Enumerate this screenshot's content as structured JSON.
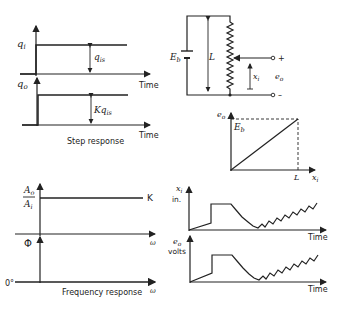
{
  "step_response": {
    "title": "Step response",
    "input_label": "q",
    "input_sub": "i",
    "output_label": "q",
    "output_sub": "o",
    "input_amplitude_label": "q",
    "input_amplitude_sub": "is",
    "output_amplitude_label": "Kq",
    "output_amplitude_sub": "is",
    "time_label_1": "Time",
    "time_label_2": "Time"
  },
  "circuit": {
    "battery_label": "E",
    "battery_sub": "b",
    "length_label": "L",
    "displacement_label": "x",
    "displacement_sub": "i",
    "output_label": "e",
    "output_sub": "o",
    "plus": "+",
    "minus": "–"
  },
  "static_characteristic": {
    "y_label": "e",
    "y_sub": "o",
    "y_max_label": "E",
    "y_max_sub": "b",
    "x_label": "x",
    "x_sub": "i",
    "x_max_label": "L"
  },
  "frequency_response": {
    "title": "Frequency response",
    "amp_num": "A",
    "amp_num_sub": "o",
    "amp_den": "A",
    "amp_den_sub": "i",
    "gain_label": "K",
    "phase_label": "Φ",
    "phase_zero": "0°",
    "omega_1": "ω",
    "omega_2": "ω"
  },
  "time_plots": {
    "input_label": "x",
    "input_sub": "i",
    "input_unit": "in.",
    "output_label": "e",
    "output_sub": "o",
    "output_unit": "volts",
    "time_label_1": "Time",
    "time_label_2": "Time"
  }
}
